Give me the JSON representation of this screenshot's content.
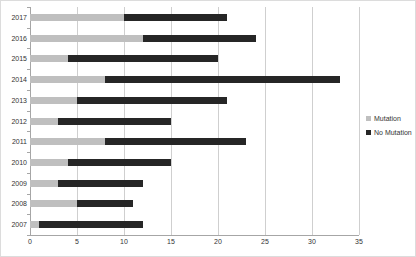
{
  "chart_data": {
    "type": "bar",
    "orientation": "horizontal",
    "stacked": true,
    "title": "",
    "xlabel": "",
    "ylabel": "",
    "categories": [
      "2017",
      "2016",
      "2015",
      "2014",
      "2013",
      "2012",
      "2011",
      "2010",
      "2009",
      "2008",
      "2007"
    ],
    "series": [
      {
        "name": "Mutation",
        "color": "#bfbfbf",
        "values": [
          10,
          12,
          4,
          8,
          5,
          3,
          8,
          4,
          3,
          5,
          1
        ]
      },
      {
        "name": "No Mutation",
        "color": "#262626",
        "values": [
          11,
          12,
          16,
          25,
          16,
          12,
          15,
          11,
          9,
          6,
          11
        ]
      }
    ],
    "totals": [
      21,
      24,
      20,
      33,
      21,
      15,
      23,
      15,
      12,
      11,
      12
    ],
    "x_axis": {
      "min": 0,
      "max": 35,
      "tick_step": 5,
      "tick_labels": [
        "0",
        "5",
        "10",
        "15",
        "20",
        "25",
        "30",
        "35"
      ]
    },
    "legend": {
      "position": "right",
      "entries": [
        "Mutation",
        "No Mutation"
      ]
    },
    "grid": true,
    "colors": {
      "background": "#ffffff",
      "gridline": "#cfcfcf",
      "axis": "#a6a6a6",
      "text": "#333333"
    }
  }
}
